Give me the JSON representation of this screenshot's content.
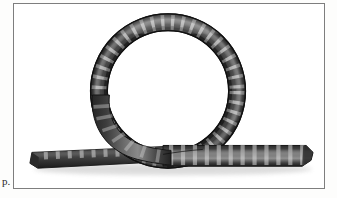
{
  "page": {
    "background_color": "#fdfdfc",
    "margin_note": "p."
  },
  "figure": {
    "frame": {
      "border_color": "#7e7e7e",
      "fill_color": "#ffffff",
      "x": 13,
      "y": 3,
      "width": 312,
      "height": 186
    },
    "caption": "",
    "colors": {
      "band_dark": "#3a3a3a",
      "band_mid": "#555555",
      "band_light": "#8d8d8d",
      "band_highlight": "#c9c9c9",
      "tick_mark": "#d8d8d8",
      "band_edge": "#1e1e1e",
      "shadow": "#9a9a9a"
    },
    "loop": {
      "center_x": 168,
      "center_y": 88,
      "outer_radius": 78,
      "band_width": 17,
      "tick_count": 46
    },
    "strip": {
      "left_tip_x": 18,
      "right_tip_x": 305,
      "baseline_y": 152,
      "thickness": 14,
      "tick_count": 34
    }
  }
}
